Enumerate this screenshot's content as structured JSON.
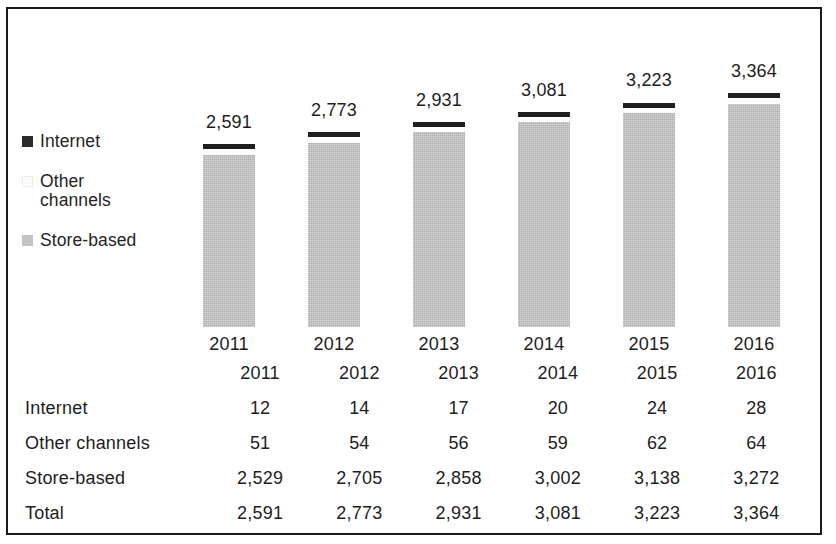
{
  "chart_data": {
    "type": "bar",
    "subtype": "stacked-column-with-data-table",
    "title": "",
    "subtitle": "",
    "xlabel": "",
    "ylabel": "",
    "grid": false,
    "legend_position": "left",
    "axis_visible": false,
    "categories": [
      "2011",
      "2012",
      "2013",
      "2014",
      "2015",
      "2016"
    ],
    "series": [
      {
        "name": "Internet",
        "values": [
          12,
          14,
          17,
          20,
          24,
          28
        ],
        "color": "#1f1f1f",
        "stack_order": "top"
      },
      {
        "name": "Other channels",
        "values": [
          51,
          54,
          56,
          59,
          62,
          64
        ],
        "color": "#fdfdfd",
        "stack_order": "middle"
      },
      {
        "name": "Store-based",
        "values": [
          2529,
          2705,
          2858,
          3002,
          3138,
          3272
        ],
        "color": "#c0c0c0",
        "stack_order": "bottom"
      }
    ],
    "totals": [
      2591,
      2773,
      2931,
      3081,
      3223,
      3364
    ],
    "bar_labels": [
      "2,591",
      "2,773",
      "2,931",
      "3,081",
      "3,223",
      "3,364"
    ],
    "ylim": [
      0,
      3600
    ]
  },
  "legend": {
    "items": [
      {
        "label": "Internet",
        "swatch": "legend-swatch-internet",
        "color": "#2b2b2b"
      },
      {
        "label": "Other\nchannels",
        "label_line1": "Other",
        "label_line2": "channels",
        "swatch": "legend-swatch-other-channels",
        "color": "#fbfbfb"
      },
      {
        "label": "Store-based",
        "swatch": "legend-swatch-store-based",
        "color": "#c3c3c3"
      }
    ]
  },
  "bars": [
    {
      "year": "2011",
      "total_label": "2,591"
    },
    {
      "year": "2012",
      "total_label": "2,773"
    },
    {
      "year": "2013",
      "total_label": "2,931"
    },
    {
      "year": "2014",
      "total_label": "3,081"
    },
    {
      "year": "2015",
      "total_label": "3,223"
    },
    {
      "year": "2016",
      "total_label": "3,364"
    }
  ],
  "table": {
    "corner_label": "",
    "columns": [
      "2011",
      "2012",
      "2013",
      "2014",
      "2015",
      "2016"
    ],
    "rows": [
      {
        "label": "Internet",
        "values": [
          "12",
          "14",
          "17",
          "20",
          "24",
          "28"
        ]
      },
      {
        "label": "Other channels",
        "values": [
          "51",
          "54",
          "56",
          "59",
          "62",
          "64"
        ]
      },
      {
        "label": "Store-based",
        "values": [
          "2,529",
          "2,705",
          "2,858",
          "3,002",
          "3,138",
          "3,272"
        ]
      },
      {
        "label": "Total",
        "values": [
          "2,591",
          "2,773",
          "2,931",
          "3,081",
          "3,223",
          "3,364"
        ]
      }
    ]
  },
  "colors": {
    "frame": "#1b1b1b",
    "internet": "#1f1f1f",
    "other_channels": "#fdfdfd",
    "store_based": "#c0c0c0",
    "text": "#1d1d1d",
    "background": "#ffffff"
  }
}
